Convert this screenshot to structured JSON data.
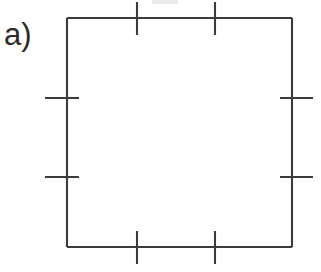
{
  "figure": {
    "panel_label": "a)",
    "caption_text": "",
    "background_color": "#ffffff",
    "line_color": "#3b3b3b",
    "line_width_px": 2,
    "canvas": {
      "width": 321,
      "height": 272
    },
    "shape": {
      "name": "square",
      "left_x": 67,
      "right_x": 292,
      "top_y": 18,
      "bottom_y": 247,
      "width_px": 225,
      "height_px": 229
    },
    "ticks": {
      "tick_length_px": 33,
      "top": [
        {
          "name": "top-tick-1",
          "x": 137,
          "y1": 2,
          "y2": 35
        },
        {
          "name": "top-tick-2",
          "x": 215,
          "y1": 2,
          "y2": 35
        }
      ],
      "bottom": [
        {
          "name": "bottom-tick-1",
          "x": 137,
          "y1": 231,
          "y2": 264
        },
        {
          "name": "bottom-tick-2",
          "x": 215,
          "y1": 231,
          "y2": 264
        }
      ],
      "left": [
        {
          "name": "left-tick-1",
          "y": 98,
          "x1": 45,
          "x2": 79
        },
        {
          "name": "left-tick-2",
          "y": 177,
          "x1": 45,
          "x2": 79
        }
      ],
      "right": [
        {
          "name": "right-tick-1",
          "y": 98,
          "x1": 280,
          "x2": 313
        },
        {
          "name": "right-tick-2",
          "y": 177,
          "x1": 280,
          "x2": 313
        }
      ]
    },
    "artifacts": [
      {
        "name": "scan-smudge-top",
        "x": 152,
        "y": 0,
        "width": 26,
        "height": 4
      }
    ]
  }
}
